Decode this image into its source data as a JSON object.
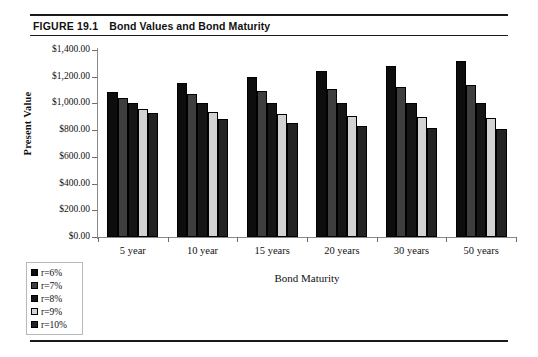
{
  "figure": {
    "label": "FIGURE 19.1",
    "title": "Bond Values and Bond Maturity"
  },
  "colors": {
    "series": [
      "#0d0d0d",
      "#3e3e3e",
      "#151515",
      "#d2d2d2",
      "#232323"
    ],
    "axis": "#8a8a8a",
    "text": "#111111",
    "rule": "#1a1a1a",
    "legend_border": "#b9b9b9"
  },
  "chart_data": {
    "type": "bar",
    "title": "Bond Values and Bond Maturity",
    "xlabel": "Bond Maturity",
    "ylabel": "Present Value",
    "categories": [
      "5 year",
      "10 year",
      "15 years",
      "20 years",
      "30 years",
      "50 years"
    ],
    "ylim": [
      0,
      1400
    ],
    "ytick_values": [
      0,
      200,
      400,
      600,
      800,
      1000,
      1200,
      1400
    ],
    "ytick_labels": [
      "$0.00",
      "$200.00",
      "$400.00",
      "$600.00",
      "$800.00",
      "$1,000.00",
      "$1,200.00",
      "$1,400.00"
    ],
    "grid": false,
    "legend_position": "below-left",
    "series": [
      {
        "name": "r=6%",
        "color": "#0d0d0d",
        "values": [
          1085,
          1150,
          1200,
          1240,
          1277,
          1315
        ]
      },
      {
        "name": "r=7%",
        "color": "#3e3e3e",
        "values": [
          1042,
          1072,
          1092,
          1107,
          1125,
          1139
        ]
      },
      {
        "name": "r=8%",
        "color": "#151515",
        "values": [
          1000,
          1000,
          1000,
          1000,
          1000,
          1000
        ]
      },
      {
        "name": "r=9%",
        "color": "#d2d2d2",
        "values": [
          962,
          938,
          920,
          908,
          898,
          890
        ]
      },
      {
        "name": "r=10%",
        "color": "#232323",
        "values": [
          925,
          880,
          855,
          830,
          815,
          805
        ]
      }
    ]
  }
}
